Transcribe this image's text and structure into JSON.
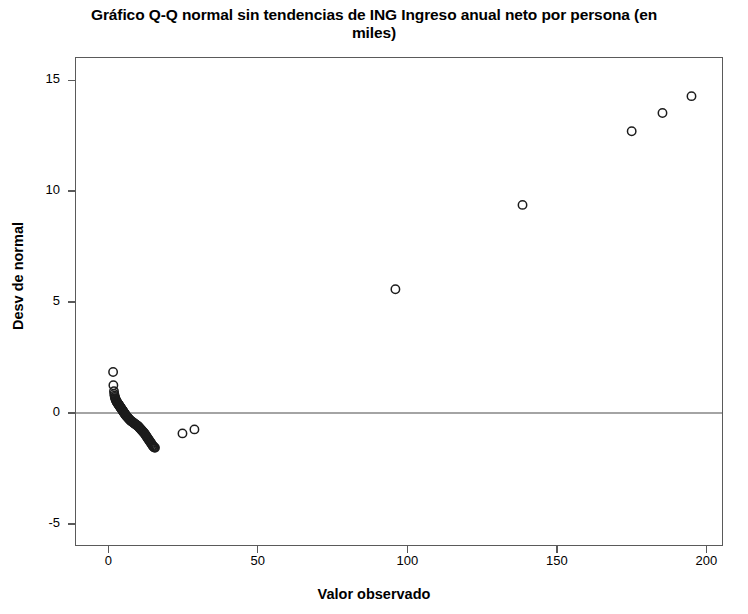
{
  "chart_data": {
    "type": "scatter",
    "title": "Gráfico Q-Q normal sin tendencias de ING Ingreso anual neto por persona (en miles)",
    "title_line1": "Gráfico Q-Q normal sin tendencias de ING Ingreso anual neto por persona (en",
    "title_line2": "miles)",
    "xlabel": "Valor observado",
    "ylabel": "Desv de normal",
    "xlim": [
      -10.8,
      205.2
    ],
    "ylim": [
      -5.95,
      16.0
    ],
    "xticks": [
      0,
      50,
      100,
      150,
      200
    ],
    "xtick_labels": [
      "0",
      "50",
      "100",
      "150",
      "200"
    ],
    "yticks": [
      -5,
      0,
      5,
      10,
      15
    ],
    "ytick_labels": [
      "-5",
      "0",
      "5",
      "10",
      "15"
    ],
    "grid": false,
    "legend": null,
    "reference_line": {
      "type": "horizontal",
      "y": 0,
      "color": "#4a4a4a"
    },
    "marker": {
      "shape": "circle",
      "filled": false,
      "radius": 4.2,
      "edge_color": "#1c1c1c",
      "edge_width": 1.5
    },
    "series": [
      {
        "name": "Desviación de la normal",
        "marker_color": "#1c1c1c",
        "points": [
          [
            1.6,
            1.85
          ],
          [
            1.7,
            1.25
          ],
          [
            1.9,
            0.98
          ],
          [
            2.0,
            0.86
          ],
          [
            2.1,
            0.78
          ],
          [
            2.2,
            0.72
          ],
          [
            2.3,
            0.67
          ],
          [
            2.4,
            0.63
          ],
          [
            2.5,
            0.6
          ],
          [
            2.6,
            0.57
          ],
          [
            2.7,
            0.54
          ],
          [
            2.8,
            0.51
          ],
          [
            2.9,
            0.49
          ],
          [
            3.0,
            0.47
          ],
          [
            3.1,
            0.45
          ],
          [
            3.2,
            0.43
          ],
          [
            3.3,
            0.41
          ],
          [
            3.4,
            0.39
          ],
          [
            3.5,
            0.37
          ],
          [
            3.6,
            0.35
          ],
          [
            3.7,
            0.33
          ],
          [
            3.8,
            0.31
          ],
          [
            3.9,
            0.29
          ],
          [
            4.0,
            0.27
          ],
          [
            4.1,
            0.25
          ],
          [
            4.2,
            0.23
          ],
          [
            4.3,
            0.21
          ],
          [
            4.4,
            0.19
          ],
          [
            4.5,
            0.17
          ],
          [
            4.6,
            0.15
          ],
          [
            4.7,
            0.13
          ],
          [
            4.8,
            0.11
          ],
          [
            4.9,
            0.09
          ],
          [
            5.0,
            0.07
          ],
          [
            5.1,
            0.05
          ],
          [
            5.2,
            0.03
          ],
          [
            5.3,
            0.01
          ],
          [
            5.4,
            -0.01
          ],
          [
            5.5,
            -0.03
          ],
          [
            5.6,
            -0.05
          ],
          [
            5.7,
            -0.07
          ],
          [
            5.8,
            -0.09
          ],
          [
            5.9,
            -0.11
          ],
          [
            6.0,
            -0.13
          ],
          [
            6.2,
            -0.16
          ],
          [
            6.4,
            -0.19
          ],
          [
            6.6,
            -0.22
          ],
          [
            6.8,
            -0.25
          ],
          [
            7.0,
            -0.28
          ],
          [
            7.2,
            -0.31
          ],
          [
            7.4,
            -0.34
          ],
          [
            7.6,
            -0.36
          ],
          [
            7.8,
            -0.38
          ],
          [
            8.0,
            -0.4
          ],
          [
            8.2,
            -0.42
          ],
          [
            8.4,
            -0.44
          ],
          [
            8.6,
            -0.46
          ],
          [
            8.8,
            -0.48
          ],
          [
            9.0,
            -0.5
          ],
          [
            9.2,
            -0.52
          ],
          [
            9.4,
            -0.54
          ],
          [
            9.6,
            -0.56
          ],
          [
            9.8,
            -0.58
          ],
          [
            10.0,
            -0.6
          ],
          [
            10.2,
            -0.63
          ],
          [
            10.4,
            -0.66
          ],
          [
            10.6,
            -0.69
          ],
          [
            10.8,
            -0.72
          ],
          [
            11.0,
            -0.75
          ],
          [
            11.2,
            -0.78
          ],
          [
            11.4,
            -0.81
          ],
          [
            11.6,
            -0.84
          ],
          [
            11.8,
            -0.87
          ],
          [
            12.0,
            -0.9
          ],
          [
            12.2,
            -0.94
          ],
          [
            12.4,
            -0.98
          ],
          [
            12.6,
            -1.02
          ],
          [
            12.8,
            -1.06
          ],
          [
            13.0,
            -1.1
          ],
          [
            13.2,
            -1.14
          ],
          [
            13.4,
            -1.18
          ],
          [
            13.6,
            -1.22
          ],
          [
            13.8,
            -1.26
          ],
          [
            14.0,
            -1.3
          ],
          [
            14.2,
            -1.34
          ],
          [
            14.4,
            -1.38
          ],
          [
            14.6,
            -1.42
          ],
          [
            14.8,
            -1.46
          ],
          [
            15.0,
            -1.5
          ],
          [
            15.2,
            -1.53
          ],
          [
            15.4,
            -1.55
          ],
          [
            15.6,
            -1.57
          ],
          [
            24.8,
            -0.92
          ],
          [
            28.8,
            -0.74
          ],
          [
            96.0,
            5.58
          ],
          [
            138.5,
            9.38
          ],
          [
            175.0,
            12.7
          ],
          [
            185.3,
            13.52
          ],
          [
            195.0,
            14.28
          ]
        ]
      }
    ]
  },
  "axes": {
    "x_title": "Valor observado",
    "y_title": "Desv de normal"
  }
}
